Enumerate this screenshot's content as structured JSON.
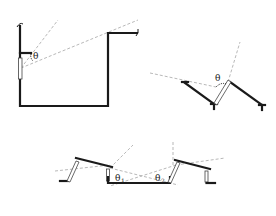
{
  "figure_a": {
    "angle_label": "θ"
  },
  "figure_b": {
    "angle_label": "θ"
  },
  "figure_c": {
    "angle_label_1": "θ",
    "angle_sub_1": "1",
    "angle_label_2": "θ",
    "angle_sub_2": "2"
  },
  "colors": {
    "wall": "#1a1a1a",
    "dashed_ray": "#9a9a9a",
    "background": "#ffffff"
  }
}
